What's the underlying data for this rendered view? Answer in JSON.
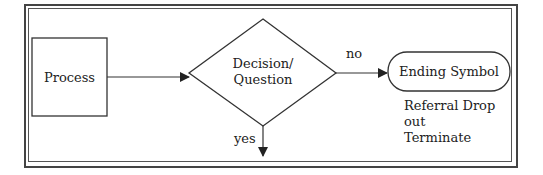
{
  "diagram": {
    "type": "flowchart",
    "nodes": [
      {
        "id": "process",
        "shape": "rectangle",
        "label": "Process"
      },
      {
        "id": "decision",
        "shape": "diamond",
        "label_line1": "Decision/",
        "label_line2": "Question"
      },
      {
        "id": "end",
        "shape": "rounded-terminal",
        "label": "Ending Symbol"
      }
    ],
    "edges": [
      {
        "from": "process",
        "to": "decision",
        "label": ""
      },
      {
        "from": "decision",
        "to": "end",
        "label": "no"
      },
      {
        "from": "decision",
        "to": "below",
        "label": "yes"
      }
    ],
    "annotation": {
      "line1": "Referral Drop",
      "line2": "out",
      "line3": "Terminate"
    },
    "colors": {
      "stroke": "#222222",
      "background": "#ffffff"
    }
  }
}
